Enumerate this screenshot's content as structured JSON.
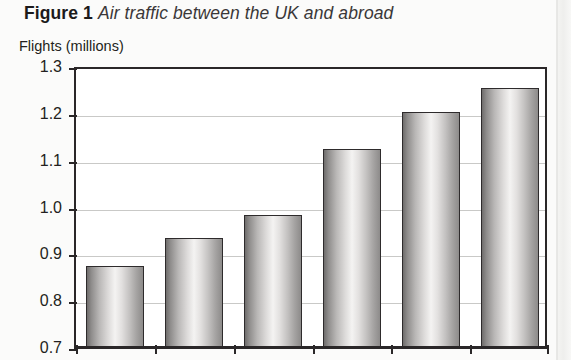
{
  "caption": {
    "figure_label": "Figure 1",
    "title": "Air traffic between the UK and abroad"
  },
  "axis_unit_label": "Flights (millions)",
  "chart_data": {
    "type": "bar",
    "title": "Air traffic between the UK and abroad",
    "xlabel": "",
    "ylabel": "Flights (millions)",
    "ylim": [
      0.7,
      1.3
    ],
    "ytick_labels": [
      "1.3",
      "1.2",
      "1.1",
      "1.0",
      "0.9",
      "0.8",
      "0.7"
    ],
    "ytick_values": [
      1.3,
      1.2,
      1.1,
      1.0,
      0.9,
      0.8,
      0.7
    ],
    "grid": true,
    "legend": "none",
    "categories": [
      "",
      "",
      "",
      "",
      "",
      ""
    ],
    "values": [
      0.87,
      0.93,
      0.98,
      1.12,
      1.2,
      1.25
    ],
    "note": "x-axis category labels are cropped off below the visible image area"
  },
  "colors": {
    "page_background": "#fbfbfa",
    "plot_background": "#ffffff",
    "axis": "#2a2728",
    "gridline": "#c9c9c7",
    "bar_light": "#f4f3f2",
    "bar_dark": "#6f6d6c",
    "text": "#231f20"
  }
}
